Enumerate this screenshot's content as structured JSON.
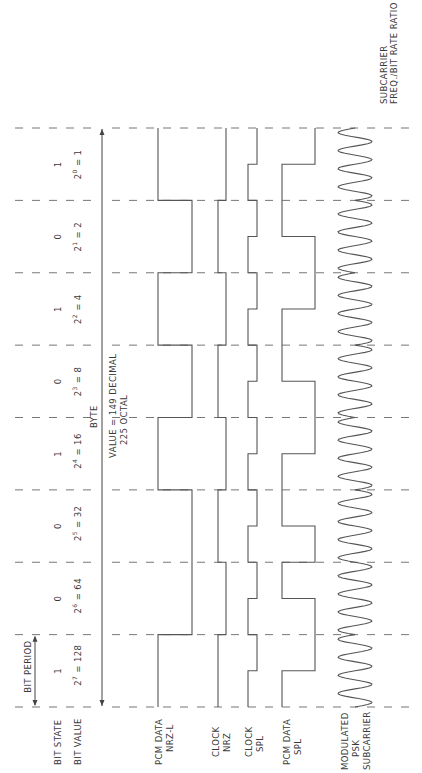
{
  "diagram": {
    "title_note": {
      "line1": "SUBCARRIER",
      "line2": "FREQ./BIT RATE RATIO = 4"
    },
    "row_labels": {
      "bit_state": "BIT STATE",
      "bit_value": "BIT VALUE",
      "pcm_nrzl": [
        "PCM DATA",
        "NRZ-L"
      ],
      "clock_nrz": [
        "CLOCK",
        "NRZ"
      ],
      "clock_spl": [
        "CLOCK",
        "SPL"
      ],
      "pcm_spl": [
        "PCM DATA",
        "SPL"
      ],
      "psk": [
        "MODULATED",
        "PSK",
        "SUBCARRIER"
      ]
    },
    "bit_period_label": "BIT PERIOD",
    "byte": {
      "label": "BYTE",
      "value_line1": "VALUE = 149 DECIMAL",
      "value_line2": "225 OCTAL"
    },
    "bits": [
      {
        "state": "1",
        "base": "2",
        "exp": "7",
        "value": "128"
      },
      {
        "state": "0",
        "base": "2",
        "exp": "6",
        "value": "64"
      },
      {
        "state": "0",
        "base": "2",
        "exp": "5",
        "value": "32"
      },
      {
        "state": "1",
        "base": "2",
        "exp": "4",
        "value": "16"
      },
      {
        "state": "0",
        "base": "2",
        "exp": "3",
        "value": "8"
      },
      {
        "state": "1",
        "base": "2",
        "exp": "2",
        "value": "4"
      },
      {
        "state": "0",
        "base": "2",
        "exp": "1",
        "value": "2"
      },
      {
        "state": "1",
        "base": "2",
        "exp": "0",
        "value": "1"
      }
    ],
    "subcarrier_ratio": 4
  }
}
